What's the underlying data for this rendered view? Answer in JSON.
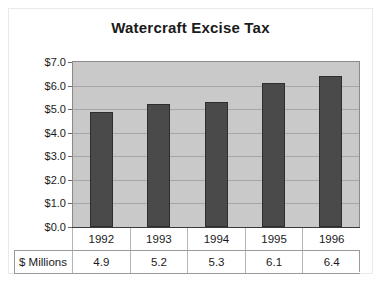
{
  "chart_data": {
    "type": "bar",
    "title": "Watercraft Excise Tax",
    "xlabel": "",
    "ylabel": "",
    "categories": [
      "1992",
      "1993",
      "1994",
      "1995",
      "1996"
    ],
    "values": [
      4.9,
      5.2,
      5.3,
      6.1,
      6.4
    ],
    "value_labels": [
      "4.9",
      "5.2",
      "5.3",
      "6.1",
      "6.4"
    ],
    "series_label": "$ Millions",
    "ylim": [
      0,
      7
    ],
    "ytick_values": [
      7.0,
      6.0,
      5.0,
      4.0,
      3.0,
      2.0,
      1.0,
      0.0
    ],
    "ytick_labels": [
      "$7.0",
      "$6.0",
      "$5.0",
      "$4.0",
      "$3.0",
      "$2.0",
      "$1.0",
      "$0.0"
    ],
    "grid": true,
    "legend": false,
    "colors": {
      "bar_fill": "#4a4a4a",
      "bar_border": "#2e2e2e",
      "plot_background": "#c9c9c9",
      "gridline": "#a6a6a6",
      "text": "#1a1a1a"
    }
  }
}
